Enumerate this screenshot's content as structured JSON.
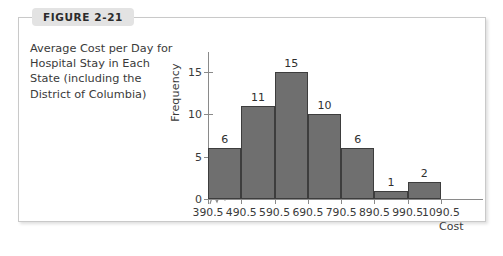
{
  "figure": {
    "tab_label": "FIGURE 2-21",
    "caption": "Average Cost per Day for Hospital Stay in Each State (including the District of Columbia)"
  },
  "chart_data": {
    "type": "bar",
    "title": "",
    "subtitle": "",
    "xlabel": "Cost",
    "ylabel": "Frequency",
    "categories": [
      "390.5-490.5",
      "490.5-590.5",
      "590.5-690.5",
      "690.5-790.5",
      "790.5-890.5",
      "890.5-990.5",
      "990.5-1090.5"
    ],
    "values": [
      6,
      11,
      15,
      10,
      6,
      1,
      2
    ],
    "bar_labels": [
      "6",
      "11",
      "15",
      "10",
      "6",
      "1",
      "2"
    ],
    "bin_edges": [
      390.5,
      490.5,
      590.5,
      690.5,
      790.5,
      890.5,
      990.5,
      1090.5
    ],
    "x_tick_labels": [
      "390.5",
      "490.5",
      "590.5",
      "690.5",
      "790.5",
      "890.5",
      "990.5",
      "1090.5"
    ],
    "y_ticks": [
      0,
      5,
      10,
      15
    ],
    "y_tick_labels": [
      "0",
      "5",
      "10",
      "15"
    ],
    "ylim": [
      0,
      16
    ],
    "xlim": [
      390.5,
      1090.5
    ],
    "grid": false,
    "legend": null,
    "axis_break": true,
    "colors": {
      "bar_fill": "#6f6f6f",
      "bar_border": "#3d3d3d",
      "axis": "#8a8a8a",
      "text": "#3a3a3a",
      "frame_border": "#c9c9c9",
      "tab_background": "#e3e3e3"
    }
  }
}
